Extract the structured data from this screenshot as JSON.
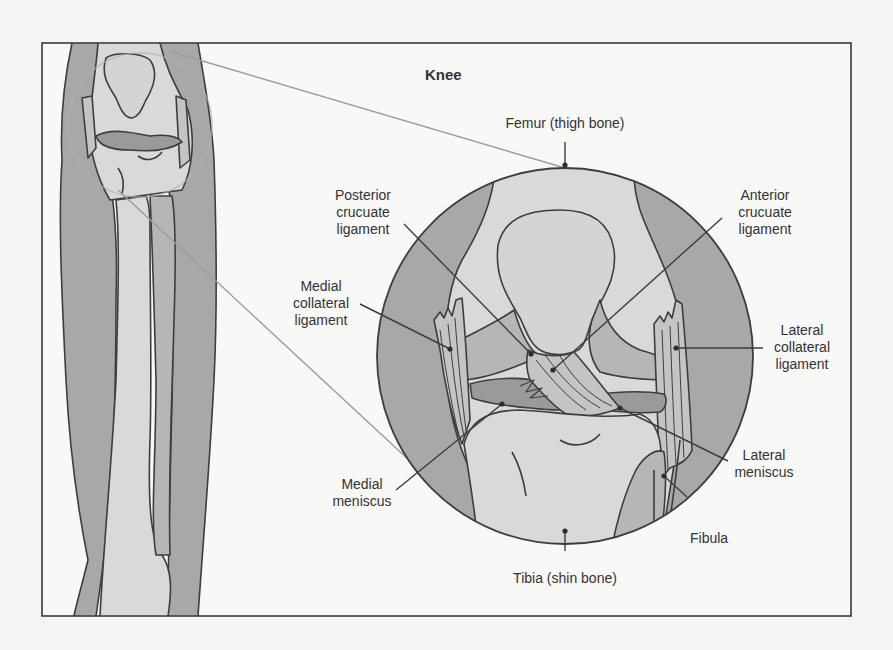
{
  "title": "Knee",
  "colors": {
    "background": "#f4f4f2",
    "frame": "#3a3a3a",
    "outline": "#3d3d3d",
    "muscle_dark": "#a8a8a8",
    "bone_light": "#d9d9d9",
    "ligament_mid": "#c4c4c4",
    "meniscus_dark": "#9a9a9a",
    "zoom_line": "#9c9c9c",
    "text": "#333333"
  },
  "labels": {
    "femur": "Femur (thigh bone)",
    "posterior_cruciate": "Posterior\ncrucuate\nligament",
    "anterior_cruciate": "Anterior\ncrucuate\nligament",
    "medial_collateral": "Medial\ncollateral\nligament",
    "lateral_collateral": "Lateral\ncollateral\nligament",
    "medial_meniscus": "Medial\nmeniscus",
    "lateral_meniscus": "Lateral\nmeniscus",
    "fibula": "Fibula",
    "tibia": "Tibia (shin bone)"
  }
}
